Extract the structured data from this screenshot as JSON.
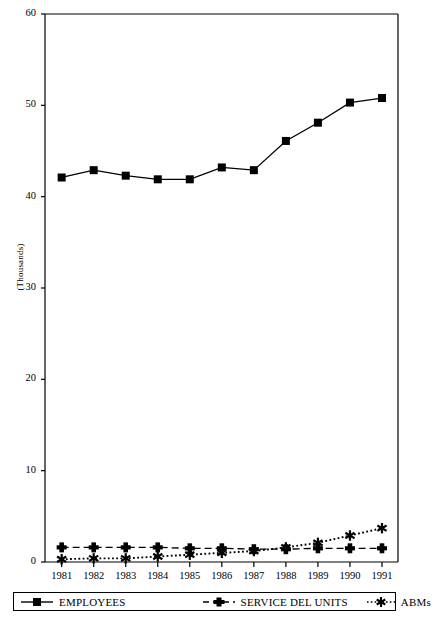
{
  "chart_data": {
    "type": "line",
    "title": "",
    "xlabel": "",
    "ylabel": "(Thousands)",
    "ylim": [
      0,
      60
    ],
    "yticks": [
      0,
      10,
      20,
      30,
      40,
      50,
      60
    ],
    "ytick_labels": [
      "0",
      "10",
      "20",
      "30",
      "40",
      "50",
      "60"
    ],
    "grid": false,
    "legend_position": "bottom",
    "categories": [
      "1981",
      "1982",
      "1983",
      "1984",
      "1985",
      "1986",
      "1987",
      "1988",
      "1989",
      "1990",
      "1991"
    ],
    "series": [
      {
        "name": "EMPLOYEES",
        "marker": "square",
        "line_style": "solid",
        "color": "#000000",
        "values": [
          42.1,
          42.9,
          42.3,
          41.9,
          41.9,
          43.2,
          42.9,
          46.1,
          48.1,
          50.3,
          50.8
        ]
      },
      {
        "name": "SERVICE DEL UNITS",
        "marker": "plus",
        "line_style": "dashed",
        "color": "#000000",
        "values": [
          1.6,
          1.6,
          1.6,
          1.6,
          1.5,
          1.5,
          1.4,
          1.4,
          1.5,
          1.5,
          1.5
        ]
      },
      {
        "name": "ABMs",
        "marker": "asterisk",
        "line_style": "dotted",
        "color": "#000000",
        "values": [
          0.3,
          0.4,
          0.4,
          0.6,
          0.8,
          1.0,
          1.2,
          1.6,
          2.1,
          2.9,
          3.7
        ]
      }
    ]
  },
  "legend": {
    "items": [
      {
        "label": "EMPLOYEES",
        "icon": "legend-square-solid-line-icon"
      },
      {
        "label": "SERVICE DEL UNITS",
        "icon": "legend-plus-dashed-line-icon"
      },
      {
        "label": "ABMs",
        "icon": "legend-asterisk-dotted-line-icon"
      }
    ]
  },
  "axes": {
    "y_title": "(Thousands)"
  },
  "colors": {
    "ink": "#000000",
    "background": "#ffffff"
  }
}
